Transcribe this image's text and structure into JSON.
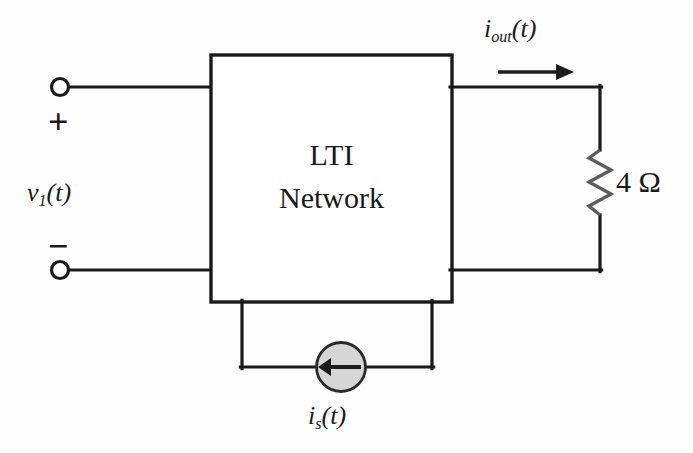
{
  "diagram": {
    "block": {
      "line1": "LTI",
      "line2": "Network"
    },
    "labels": {
      "input_voltage_base": "v",
      "input_voltage_sub": "1",
      "input_voltage_arg": "(t)",
      "output_current_base": "i",
      "output_current_sub": "out",
      "output_current_arg": "(t)",
      "source_current_base": "i",
      "source_current_sub": "s",
      "source_current_arg": "(t)",
      "polarity_plus": "+",
      "polarity_minus": "−",
      "resistor_value": "4 Ω"
    },
    "icons": {
      "terminal_top": "open-terminal-node",
      "terminal_bottom": "open-terminal-node",
      "resistor": "zigzag-resistor",
      "current_source": "circle-current-source",
      "current_direction_output": "arrow-right",
      "current_direction_source": "arrow-left"
    },
    "colors": {
      "background": "#fdfdfd",
      "wire": "#1a1a1a",
      "block_border": "#1a1a1a",
      "block_fill": "#ffffff",
      "resistor_stroke": "#5d5d5d",
      "source_fill": "#d6d6d6",
      "source_stroke": "#2a2a2a",
      "text": "#1a1a1a"
    }
  }
}
